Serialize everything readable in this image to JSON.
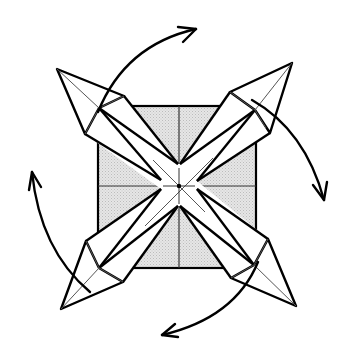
{
  "diagram": {
    "title": "Origami folding step: swing four points",
    "type": "origami-fold-diagram",
    "colors": {
      "line": "#000000",
      "crease": "#444444",
      "paper_shade": "#d9d9d9",
      "paper_white": "#ffffff",
      "background": "#ffffff"
    },
    "base_square": {
      "x": 98,
      "y": 106,
      "width": 158,
      "height": 162,
      "center": [
        179,
        186
      ]
    },
    "arms": [
      {
        "id": "top-left",
        "tip": [
          57,
          69
        ],
        "shoulder_a": [
          124,
          96
        ],
        "shoulder_b": [
          85,
          134
        ],
        "node": [
          99,
          108
        ],
        "notch_a": [
          178,
          164
        ],
        "notch_b": [
          161,
          180
        ]
      },
      {
        "id": "top-right",
        "tip": [
          292,
          63
        ],
        "shoulder_a": [
          230,
          92
        ],
        "shoulder_b": [
          270,
          133
        ],
        "node": [
          255,
          110
        ],
        "notch_a": [
          180,
          164
        ],
        "notch_b": [
          197,
          181
        ]
      },
      {
        "id": "bottom-left",
        "tip": [
          61,
          309
        ],
        "shoulder_a": [
          86,
          241
        ],
        "shoulder_b": [
          123,
          282
        ],
        "node": [
          99,
          268
        ],
        "notch_a": [
          161,
          189
        ],
        "notch_b": [
          178,
          206
        ]
      },
      {
        "id": "bottom-right",
        "tip": [
          296,
          306
        ],
        "shoulder_a": [
          268,
          239
        ],
        "shoulder_b": [
          231,
          278
        ],
        "node": [
          254,
          265
        ],
        "notch_a": [
          197,
          189
        ],
        "notch_b": [
          180,
          206
        ]
      }
    ],
    "arrows": [
      {
        "id": "arrow-top",
        "direction": "clockwise",
        "path": "M 98 112 Q 125 45 196 29"
      },
      {
        "id": "arrow-right",
        "direction": "clockwise",
        "path": "M 252 100 Q 305 130 324 200"
      },
      {
        "id": "arrow-bottom",
        "direction": "clockwise",
        "path": "M 258 262 Q 235 318 162 335"
      },
      {
        "id": "arrow-left",
        "direction": "clockwise",
        "path": "M 90 292 Q 40 250 32 172"
      }
    ]
  }
}
